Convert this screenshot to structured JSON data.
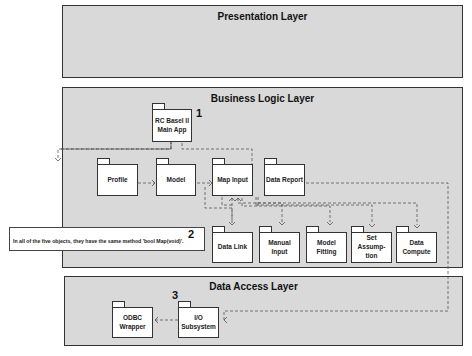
{
  "diagram": {
    "type": "uml-package-diagram",
    "layers": [
      {
        "id": "presentation",
        "title": "Presentation Layer"
      },
      {
        "id": "business",
        "title": "Business Logic Layer"
      },
      {
        "id": "data_access",
        "title": "Data Access Layer"
      }
    ],
    "packages": {
      "main_app": {
        "label": "RC Basel II\nMain App",
        "number": "1"
      },
      "profile": {
        "label": "Profile"
      },
      "model": {
        "label": "Model"
      },
      "map_input": {
        "label": "Map Input"
      },
      "data_report": {
        "label": "Data Report"
      },
      "data_link": {
        "label": "Data Link"
      },
      "manual_input": {
        "label": "Manual\nInput"
      },
      "model_fitting": {
        "label": "Model\nFitting"
      },
      "set_assumption": {
        "label": "Set\nAssump-\ntion"
      },
      "data_compute": {
        "label": "Data\nCompute"
      },
      "odbc_wrapper": {
        "label": "ODBC\nWrapper"
      },
      "io_subsystem": {
        "label": "I/O\nSubsystem",
        "number": "3"
      }
    },
    "note": {
      "number": "2",
      "text": "In all of the five objects, they have the same method 'bool Map(void)'."
    },
    "dependencies": [
      {
        "from": "main_app",
        "to": "profile"
      },
      {
        "from": "main_app",
        "to": "data_report"
      },
      {
        "from": "profile",
        "to": "model"
      },
      {
        "from": "model",
        "to": "map_input"
      },
      {
        "from": "map_input",
        "to": "data_report"
      },
      {
        "from": "map_input",
        "to": "data_link"
      },
      {
        "from": "map_input",
        "to": "manual_input"
      },
      {
        "from": "map_input",
        "to": "model_fitting"
      },
      {
        "from": "map_input",
        "to": "set_assumption"
      },
      {
        "from": "map_input",
        "to": "data_compute"
      },
      {
        "from": "data_report",
        "to": "io_subsystem"
      },
      {
        "from": "io_subsystem",
        "to": "odbc_wrapper"
      }
    ]
  }
}
